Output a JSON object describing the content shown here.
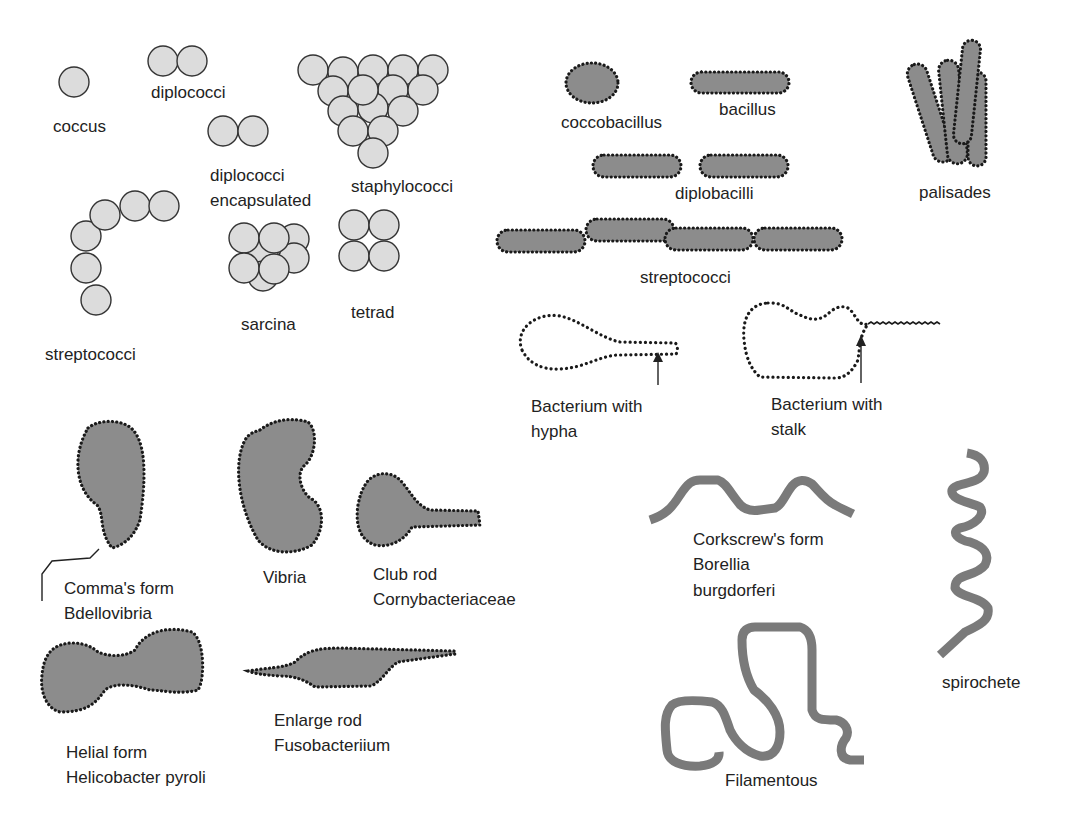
{
  "colors": {
    "coccus_fill": "#dcdcdc",
    "rod_fill": "#8c8c8c",
    "outline": "#1a1a1a",
    "filament": "#7a7a7a",
    "text": "#222222"
  },
  "cocci": {
    "coccus": "coccus",
    "diplococci": "diplococci",
    "diplococci_encapsulated": [
      "diplococci",
      "encapsulated"
    ],
    "staphylococci": "staphylococci",
    "streptococci": "streptococci",
    "sarcina": "sarcina",
    "tetrad": "tetrad"
  },
  "bacilli": {
    "coccobacillus": "coccobacillus",
    "bacillus": "bacillus",
    "diplobacilli": "diplobacilli",
    "palisades": "palisades",
    "streptococci": "streptococci"
  },
  "appendaged": {
    "hypha": [
      "Bacterium with",
      "hypha"
    ],
    "stalk": [
      "Bacterium with",
      "stalk"
    ]
  },
  "irregular": {
    "comma": [
      "Comma's form",
      "Bdellovibria"
    ],
    "vibria": "Vibria",
    "club_rod": [
      "Club rod",
      "Cornybacteriaceae"
    ],
    "helial": [
      "Helial form",
      "Helicobacter pyroli"
    ],
    "enlarge_rod": [
      "Enlarge rod",
      "Fusobacteriium"
    ]
  },
  "spiral": {
    "corkscrew": [
      "Corkscrew's form",
      "Borellia",
      "burgdorferi"
    ],
    "filamentous": "Filamentous",
    "spirochete": "spirochete"
  }
}
